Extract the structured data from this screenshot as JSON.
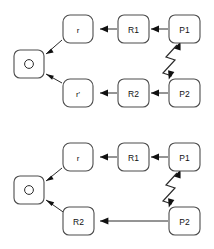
{
  "figure": {
    "background_color": "#ffffff",
    "stroke_color": "#2b2b2b",
    "box_stroke_color": "#4d4d4d",
    "label_color": "#111111",
    "diagrams": [
      {
        "id": "top-diagram",
        "name": "two-branch-reflection-diagram",
        "nodes": [
          {
            "id": "o",
            "label": "O",
            "x": 31,
            "y": 64
          },
          {
            "id": "r",
            "label": "r",
            "x": 79,
            "y": 29
          },
          {
            "id": "rp",
            "label": "r'",
            "x": 79,
            "y": 93
          },
          {
            "id": "r1",
            "label": "R1",
            "x": 133,
            "y": 29
          },
          {
            "id": "r2",
            "label": "R2",
            "x": 133,
            "y": 93
          },
          {
            "id": "p1",
            "label": "P1",
            "x": 184,
            "y": 29
          },
          {
            "id": "p2",
            "label": "P2",
            "x": 184,
            "y": 93
          }
        ],
        "edges": [
          {
            "from": "r",
            "to": "o",
            "kind": "straight"
          },
          {
            "from": "rp",
            "to": "o",
            "kind": "straight"
          },
          {
            "from": "r1",
            "to": "r",
            "kind": "straight"
          },
          {
            "from": "r2",
            "to": "rp",
            "kind": "straight"
          },
          {
            "from": "p1",
            "to": "r1",
            "kind": "straight"
          },
          {
            "from": "p2",
            "to": "r2",
            "kind": "straight"
          },
          {
            "from": "p2",
            "to": "p1",
            "kind": "zigzag",
            "double_headed": true
          }
        ]
      },
      {
        "id": "bottom-diagram",
        "name": "single-branch-reflection-diagram",
        "nodes": [
          {
            "id": "o",
            "label": "O",
            "x": 31,
            "y": 190
          },
          {
            "id": "r",
            "label": "r",
            "x": 79,
            "y": 157
          },
          {
            "id": "r1",
            "label": "R1",
            "x": 133,
            "y": 157
          },
          {
            "id": "p1",
            "label": "P1",
            "x": 184,
            "y": 157
          },
          {
            "id": "r2",
            "label": "R2",
            "x": 79,
            "y": 221
          },
          {
            "id": "p2",
            "label": "P2",
            "x": 184,
            "y": 221
          }
        ],
        "edges": [
          {
            "from": "r",
            "to": "o",
            "kind": "straight"
          },
          {
            "from": "r2",
            "to": "o",
            "kind": "straight"
          },
          {
            "from": "r1",
            "to": "r",
            "kind": "straight"
          },
          {
            "from": "p1",
            "to": "r1",
            "kind": "straight"
          },
          {
            "from": "p2",
            "to": "r2",
            "kind": "straight"
          },
          {
            "from": "p2",
            "to": "p1",
            "kind": "zigzag",
            "double_headed": true
          }
        ]
      }
    ]
  },
  "labels": {
    "origin": "O",
    "ray": "r",
    "ray_prime": "r'",
    "reflector_1": "R1",
    "reflector_2": "R2",
    "point_1": "P1",
    "point_2": "P2"
  }
}
